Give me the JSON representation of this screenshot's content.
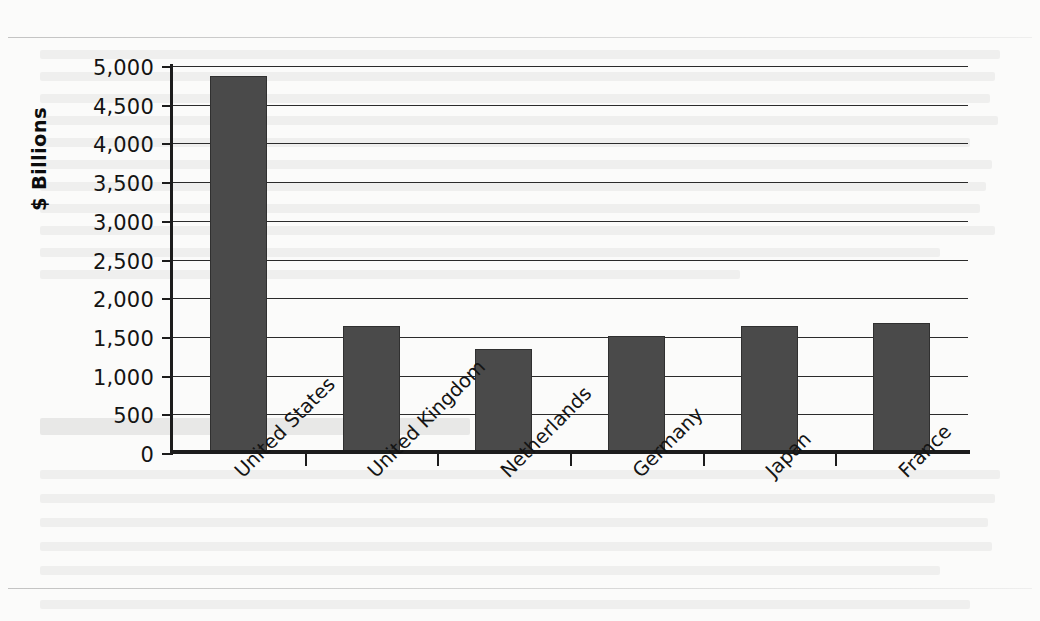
{
  "chart_data": {
    "type": "bar",
    "title": "",
    "xlabel": "",
    "ylabel": "$ Billions",
    "categories": [
      "United States",
      "United Kingdom",
      "Netherlands",
      "Germany",
      "Japan",
      "France"
    ],
    "values": [
      4875,
      1635,
      1340,
      1515,
      1640,
      1680
    ],
    "ylim": [
      0,
      5000
    ],
    "ytick_labels": [
      "5,000",
      "4,500",
      "4,000",
      "3,500",
      "3,000",
      "2,500",
      "2,000",
      "1,500",
      "1,000",
      "500",
      "0"
    ],
    "ytick_values": [
      5000,
      4500,
      4000,
      3500,
      3000,
      2500,
      2000,
      1500,
      1000,
      500,
      0
    ],
    "grid": true,
    "legend": false,
    "legend_position": "none",
    "bar_color": "#4a4a4a",
    "axis_color": "#1c1c1c",
    "background_color": "#fbfbfa"
  },
  "page": {
    "rule_color": "#9a9a9a"
  }
}
